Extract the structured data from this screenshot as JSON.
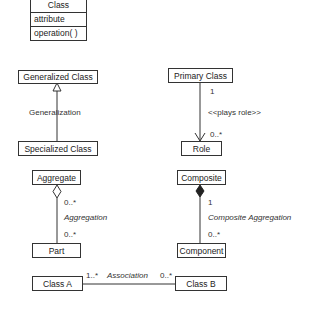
{
  "class_notation": {
    "name": "Class",
    "attribute": "attribute",
    "operation": "operation( )"
  },
  "generalization": {
    "parent": "Generalized Class",
    "child": "Specialized Class",
    "label": "Generalization"
  },
  "role": {
    "primary": "Primary Class",
    "role": "Role",
    "label": "<<plays role>>",
    "mult_source": "1",
    "mult_target": "0..*"
  },
  "aggregation": {
    "whole": "Aggregate",
    "part": "Part",
    "label": "Aggregation",
    "mult_whole": "0..*",
    "mult_part": "0..*"
  },
  "composition": {
    "whole": "Composite",
    "part": "Component",
    "label": "Composite Aggregation",
    "mult_whole": "1",
    "mult_part": "0..*"
  },
  "association": {
    "left": "Class A",
    "right": "Class B",
    "label": "Association",
    "mult_left": "1..*",
    "mult_right": "0..*"
  },
  "colors": {
    "line": "#333333",
    "background": "#ffffff"
  }
}
